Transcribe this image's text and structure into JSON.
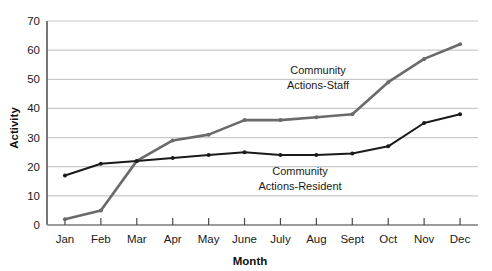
{
  "chart_data": {
    "type": "line",
    "title": "",
    "xlabel": "Month",
    "ylabel": "Activity",
    "categories": [
      "Jan",
      "Feb",
      "Mar",
      "Apr",
      "May",
      "June",
      "July",
      "Aug",
      "Sept",
      "Oct",
      "Nov",
      "Dec"
    ],
    "ylim": [
      0,
      70
    ],
    "yticks": [
      0,
      10,
      20,
      30,
      40,
      50,
      60,
      70
    ],
    "grid": "horizontal",
    "legend_position": "inline-annotations",
    "series": [
      {
        "name": "Community Actions-Staff",
        "color": "#6a6a6a",
        "values": [
          2,
          5,
          22,
          29,
          31,
          36,
          36,
          37,
          38,
          49,
          57,
          62
        ],
        "annotation": {
          "line1": "Community",
          "line2": "Actions-Staff"
        }
      },
      {
        "name": "Community Actions-Resident",
        "color": "#1a1a1a",
        "values": [
          17,
          21,
          22,
          23,
          24,
          25,
          24,
          24,
          24.5,
          27,
          35,
          38
        ],
        "annotation": {
          "line1": "Community",
          "line2": "Actions-Resident"
        }
      }
    ]
  },
  "axes": {
    "y_title": "Activity",
    "x_title": "Month",
    "y_tick_labels": [
      "0",
      "10",
      "20",
      "30",
      "40",
      "50",
      "60",
      "70"
    ],
    "x_tick_labels": [
      "Jan",
      "Feb",
      "Mar",
      "Apr",
      "May",
      "June",
      "July",
      "Aug",
      "Sept",
      "Oct",
      "Nov",
      "Dec"
    ]
  },
  "annotations": {
    "staff_line1": "Community",
    "staff_line2": "Actions-Staff",
    "resident_line1": "Community",
    "resident_line2": "Actions-Resident"
  },
  "colors": {
    "staff": "#6a6a6a",
    "resident": "#1a1a1a",
    "grid": "#c9c9c9",
    "axis": "#555555",
    "background": "#ffffff"
  }
}
